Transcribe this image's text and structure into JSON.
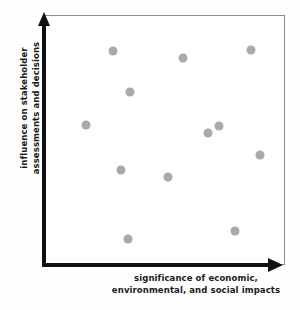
{
  "chart_data": {
    "type": "scatter",
    "title": "",
    "xlabel": "significance of economic, environmental, and social impacts",
    "ylabel": "influence on stakeholder assessments and decisions",
    "xlabel_lines": [
      "significance of economic,",
      "environmental, and social impacts"
    ],
    "ylabel_lines": [
      "influence on stakeholder",
      "assessments and decisions"
    ],
    "xlim": [
      0,
      100
    ],
    "ylim": [
      0,
      100
    ],
    "grid": false,
    "legend": null,
    "tick_labels": {
      "x": [],
      "y": []
    },
    "marker": {
      "shape": "circle",
      "color": "#a9a9a9",
      "size_px": 9
    },
    "axis_style": {
      "color": "#111111",
      "arrow_heads": true,
      "frame_color": "#8d8d8d"
    },
    "points": [
      {
        "x": 28.5,
        "y": 85.9,
        "px": 113,
        "py": 51
      },
      {
        "x": 35.6,
        "y": 69.4,
        "px": 130,
        "py": 93
      },
      {
        "x": 17.2,
        "y": 56.0,
        "px": 86,
        "py": 126
      },
      {
        "x": 57.7,
        "y": 83.1,
        "px": 183,
        "py": 58
      },
      {
        "x": 86.2,
        "y": 86.3,
        "px": 251,
        "py": 50
      },
      {
        "x": 68.2,
        "y": 52.8,
        "px": 208,
        "py": 134
      },
      {
        "x": 72.8,
        "y": 55.6,
        "px": 219,
        "py": 127
      },
      {
        "x": 89.9,
        "y": 44.0,
        "px": 260,
        "py": 156
      },
      {
        "x": 31.8,
        "y": 38.0,
        "px": 121,
        "py": 171
      },
      {
        "x": 51.5,
        "y": 35.2,
        "px": 168,
        "py": 178
      },
      {
        "x": 34.7,
        "y": 10.1,
        "px": 128,
        "py": 241
      },
      {
        "x": 79.5,
        "y": 13.3,
        "px": 235,
        "py": 233
      }
    ]
  }
}
